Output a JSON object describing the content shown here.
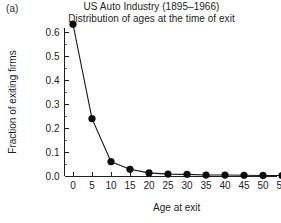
{
  "figure": {
    "panel_label": "(a)",
    "title": "US Auto Industry (1895–1966)",
    "subtitle": "Distribution of ages at the time of exit"
  },
  "chart_data": {
    "type": "line",
    "title": "US Auto Industry (1895–1966)",
    "subtitle": "Distribution of ages at the time of exit",
    "xlabel": "Age at exit",
    "ylabel": "Fraction of exiting firms",
    "x": [
      0,
      5,
      10,
      15,
      20,
      25,
      30,
      35,
      40,
      45,
      50,
      55
    ],
    "values": [
      0.635,
      0.24,
      0.06,
      0.028,
      0.013,
      0.008,
      0.007,
      0.004,
      0.004,
      0.003,
      0.002,
      0.002
    ],
    "xlim": [
      -2.5,
      57.5
    ],
    "ylim": [
      0.0,
      0.66
    ],
    "xticks": [
      0,
      5,
      10,
      15,
      20,
      25,
      30,
      35,
      40,
      45,
      50,
      55
    ],
    "xticklabels": [
      "0",
      "5",
      "10",
      "15",
      "20",
      "25",
      "30",
      "35",
      "40",
      "45",
      "50",
      "55"
    ],
    "yticks": [
      0.0,
      0.1,
      0.2,
      0.3,
      0.4,
      0.5,
      0.6
    ],
    "yticklabels": [
      "0.0",
      "0.1",
      "0.2",
      "0.3",
      "0.4",
      "0.5",
      "0.6"
    ],
    "grid": false,
    "legend": false,
    "marker": "filled-circle",
    "line_color": "#151515",
    "marker_color": "#0d0d0d"
  }
}
